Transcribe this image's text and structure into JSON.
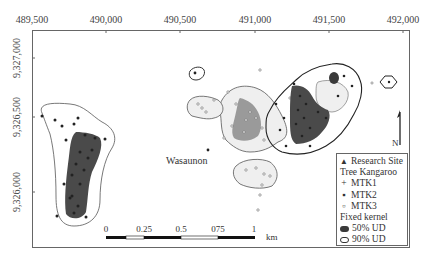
{
  "map": {
    "x_axis_ticks": [
      {
        "label": "489,500",
        "x": 32
      },
      {
        "label": "490,000",
        "x": 106
      },
      {
        "label": "490,500",
        "x": 180
      },
      {
        "label": "491,000",
        "x": 255
      },
      {
        "label": "491,500",
        "x": 329
      },
      {
        "label": "492,000",
        "x": 403
      }
    ],
    "y_axis_ticks": [
      {
        "label": "9,327,000",
        "y": 58
      },
      {
        "label": "9,326,500",
        "y": 117
      },
      {
        "label": "9,326,000",
        "y": 192
      }
    ],
    "place_label": "Wasaunon",
    "north_label": "N",
    "scale_bar": {
      "labels": [
        "0",
        "0.25",
        "0.5",
        "075",
        "1"
      ],
      "unit": "km"
    },
    "legend": {
      "research_site": "Research Site",
      "title": "Tree Kangaroo",
      "items": [
        "MTK1",
        "MTK2",
        "MTK3"
      ],
      "kernel_title": "Fixed kernel",
      "kernel_items": [
        "50% UD",
        "90% UD"
      ]
    },
    "colors": {
      "mtk1_core": "#4a4a4a",
      "mtk2_core": "#3a3a3a",
      "mtk3_core": "#9a9a9a",
      "ud90_fill": "#efefef",
      "outline": "#555555"
    }
  }
}
